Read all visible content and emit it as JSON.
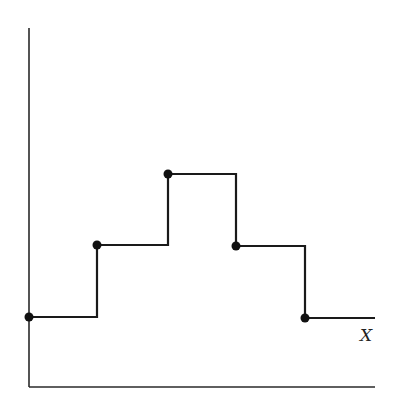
{
  "diagram": {
    "type": "step-function",
    "x_label": "X",
    "colors": {
      "line": "#1a1a1a",
      "axis": "#2a2a2a",
      "background": "#ffffff"
    },
    "axes": {
      "origin": [
        29,
        387
      ],
      "y_axis_top": 28,
      "x_axis_right": 375
    },
    "steps": [
      {
        "x_start": 29,
        "x_end": 97,
        "y": 317,
        "closed_dot_at_start": true
      },
      {
        "x_start": 97,
        "x_end": 168,
        "y": 245,
        "closed_dot_at_start": true
      },
      {
        "x_start": 168,
        "x_end": 236,
        "y": 174,
        "closed_dot_at_start": true
      },
      {
        "x_start": 236,
        "x_end": 305,
        "y": 246,
        "closed_dot_at_start": true
      },
      {
        "x_start": 305,
        "x_end": 375,
        "y": 318,
        "closed_dot_at_start": true
      }
    ],
    "levels_relative": [
      1,
      2,
      3,
      2,
      1
    ]
  }
}
